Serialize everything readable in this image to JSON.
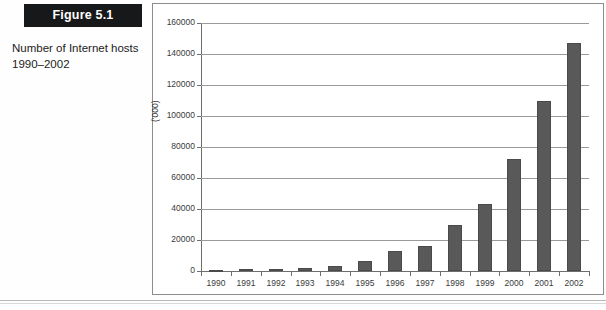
{
  "figure": {
    "banner_label": "Figure 5.1",
    "caption": "Number of Internet hosts 1990–2002"
  },
  "colors": {
    "banner_background": "#17181a",
    "banner_text": "#ffffff",
    "bar_fill": "#595959",
    "bar_stroke": "#4a4a4a",
    "gridline": "#9a9a9a",
    "axis": "#6e6e6e",
    "frame_border": "#8d8d8d",
    "page_background": "#ffffff"
  },
  "footer": {
    "ghost_text": ""
  },
  "chart_data": {
    "type": "bar",
    "title": "",
    "subtitle": "",
    "xlabel": "",
    "ylabel": "('000)",
    "ylim": [
      0,
      160000
    ],
    "ytick_step": 20000,
    "yticks": [
      0,
      20000,
      40000,
      60000,
      80000,
      100000,
      120000,
      140000,
      160000
    ],
    "ytick_labels": [
      "0",
      "20000",
      "40000",
      "60000",
      "80000",
      "100000",
      "120000",
      "140000",
      "160000"
    ],
    "grid": true,
    "grid_axis": "y",
    "legend": false,
    "legend_position": "none",
    "categories": [
      "1990",
      "1991",
      "1992",
      "1993",
      "1994",
      "1995",
      "1996",
      "1997",
      "1998",
      "1999",
      "2000",
      "2001",
      "2002"
    ],
    "values": [
      600,
      1100,
      1300,
      2200,
      3200,
      6600,
      12900,
      16100,
      29700,
      43200,
      72400,
      109600,
      147300
    ],
    "series": [
      {
        "name": "Internet hosts ('000)",
        "values": [
          600,
          1100,
          1300,
          2200,
          3200,
          6600,
          12900,
          16100,
          29700,
          43200,
          72400,
          109600,
          147300
        ]
      }
    ]
  }
}
